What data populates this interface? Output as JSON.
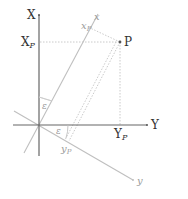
{
  "diagram": {
    "colors": {
      "axis_dark": "#555555",
      "axis_light": "#b8b8b8",
      "dotted": "#bdbdbd",
      "label_dark": "#333333",
      "label_light": "#9a9a9a"
    },
    "axes": {
      "X": {
        "label": "X"
      },
      "Y": {
        "label": "Y"
      },
      "x_rotated": {
        "label": "x"
      },
      "y_rotated": {
        "label": "y"
      }
    },
    "point": {
      "label": "P"
    },
    "projections": {
      "X_P": {
        "main": "X",
        "sub": "P"
      },
      "Y_P": {
        "main": "Y",
        "sub": "P"
      },
      "x_P": {
        "main": "x",
        "sub": "P"
      },
      "y_P": {
        "main": "y",
        "sub": "P"
      }
    },
    "angles": [
      {
        "label": "ε",
        "between": "X and x"
      },
      {
        "label": "ε",
        "between": "Y and y"
      }
    ]
  }
}
